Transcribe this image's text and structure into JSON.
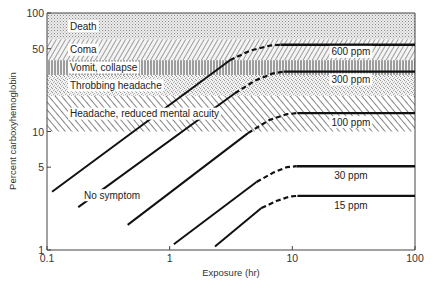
{
  "chart_data": {
    "type": "line",
    "title": "",
    "xlabel": "Exposure (hr)",
    "ylabel": "Percent carboxyhemoglobin",
    "xscale": "log",
    "yscale": "log",
    "xlim": [
      0.1,
      100
    ],
    "ylim": [
      1,
      100
    ],
    "grid": false,
    "x_ticks": [
      {
        "value": 0.1,
        "label": "0.1"
      },
      {
        "value": 1,
        "label": "1"
      },
      {
        "value": 10,
        "label": "10"
      },
      {
        "value": 100,
        "label": "100"
      }
    ],
    "y_ticks": [
      {
        "value": 1,
        "label": "1"
      },
      {
        "value": 5,
        "label": "5"
      },
      {
        "value": 10,
        "label": "10"
      },
      {
        "value": 50,
        "label": "50"
      },
      {
        "value": 100,
        "label": "100"
      }
    ],
    "bands": [
      {
        "name": "Death",
        "y_from": 60,
        "y_to": 100,
        "pattern": "dots"
      },
      {
        "name": "Coma",
        "y_from": 40,
        "y_to": 60,
        "pattern": "forward-hatch"
      },
      {
        "name": "Vomit, collapse",
        "y_from": 30,
        "y_to": 40,
        "pattern": "vertical-lines"
      },
      {
        "name": "Throbbing headache",
        "y_from": 20,
        "y_to": 30,
        "pattern": "stipple"
      },
      {
        "name": "Headache, reduced mental acuity",
        "y_from": 10,
        "y_to": 20,
        "pattern": "back-hatch"
      }
    ],
    "annotations": [
      {
        "text": "No symptom",
        "x": 0.2,
        "y": 2.9
      }
    ],
    "series": [
      {
        "name": "600 ppm",
        "solid_rise": [
          [
            0.11,
            3.1
          ],
          [
            3.1,
            40
          ]
        ],
        "dashed": [
          [
            3.1,
            40
          ],
          [
            4.5,
            48
          ],
          [
            6.5,
            53
          ],
          [
            8.0,
            54
          ]
        ],
        "plateau": [
          [
            8.0,
            54
          ],
          [
            100,
            54
          ]
        ],
        "label_at": [
          30,
          47
        ]
      },
      {
        "name": "300 ppm",
        "solid_rise": [
          [
            0.18,
            2.3
          ],
          [
            3.4,
            21
          ]
        ],
        "dashed": [
          [
            3.4,
            21
          ],
          [
            5.0,
            27
          ],
          [
            7.0,
            31
          ],
          [
            8.5,
            32
          ]
        ],
        "plateau": [
          [
            8.5,
            32
          ],
          [
            100,
            32
          ]
        ],
        "label_at": [
          30,
          27.5
        ]
      },
      {
        "name": "100 ppm",
        "solid_rise": [
          [
            0.455,
            1.63
          ],
          [
            4.35,
            9.7
          ]
        ],
        "dashed": [
          [
            4.35,
            9.7
          ],
          [
            6.5,
            12.5
          ],
          [
            9.0,
            14.0
          ],
          [
            11.0,
            14.3
          ]
        ],
        "plateau": [
          [
            11.0,
            14.3
          ],
          [
            100,
            14.3
          ]
        ],
        "label_at": [
          30,
          12.0
        ]
      },
      {
        "name": "30 ppm",
        "solid_rise": [
          [
            1.08,
            1.12
          ],
          [
            5.1,
            3.75
          ]
        ],
        "dashed": [
          [
            5.1,
            3.75
          ],
          [
            7.0,
            4.5
          ],
          [
            9.0,
            5.0
          ],
          [
            10.8,
            5.1
          ]
        ],
        "plateau": [
          [
            10.8,
            5.1
          ],
          [
            100,
            5.1
          ]
        ],
        "label_at": [
          30,
          4.25
        ]
      },
      {
        "name": "15 ppm",
        "solid_rise": [
          [
            2.34,
            1.07
          ],
          [
            5.6,
            2.26
          ]
        ],
        "dashed": [
          [
            5.6,
            2.26
          ],
          [
            7.5,
            2.6
          ],
          [
            9.5,
            2.82
          ],
          [
            11.0,
            2.86
          ]
        ],
        "plateau": [
          [
            11.0,
            2.86
          ],
          [
            100,
            2.86
          ]
        ],
        "label_at": [
          30,
          2.38
        ]
      }
    ]
  }
}
